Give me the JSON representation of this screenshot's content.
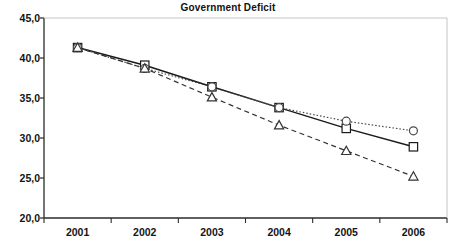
{
  "chart_data": {
    "type": "line",
    "title": "Government Deficit",
    "xlabel": "",
    "ylabel": "",
    "categories": [
      "2001",
      "2002",
      "2003",
      "2004",
      "2005",
      "2006"
    ],
    "x": [
      2001,
      2002,
      2003,
      2004,
      2005,
      2006
    ],
    "ylim": [
      20.0,
      45.0
    ],
    "ytick_labels": [
      "45,0",
      "40,0",
      "35,0",
      "30,0",
      "25,0",
      "20,0"
    ],
    "ytick_values": [
      45.0,
      40.0,
      35.0,
      30.0,
      25.0,
      20.0
    ],
    "xtick_labels": [
      "2001",
      "2002",
      "2003",
      "2004",
      "2005",
      "2006"
    ],
    "grid": false,
    "legend": "none",
    "decimal_separator": ",",
    "series": [
      {
        "name": "series-square-solid",
        "marker": "square",
        "line_style": "solid",
        "color": "#1a1a1a",
        "values": [
          41.3,
          39.1,
          36.4,
          33.8,
          31.2,
          28.9
        ]
      },
      {
        "name": "series-circle-dotted",
        "marker": "circle",
        "line_style": "dotted",
        "color": "#4a4a4a",
        "values": [
          41.3,
          38.7,
          36.4,
          33.8,
          32.1,
          30.9
        ]
      },
      {
        "name": "series-triangle-dashed",
        "marker": "triangle",
        "line_style": "dashed",
        "color": "#333333",
        "values": [
          41.3,
          38.7,
          35.1,
          31.6,
          28.4,
          25.2
        ]
      }
    ]
  },
  "axis": {
    "y_labels": [
      {
        "text": "45,0",
        "value": 45.0
      },
      {
        "text": "40,0",
        "value": 40.0
      },
      {
        "text": "35,0",
        "value": 35.0
      },
      {
        "text": "30,0",
        "value": 30.0
      },
      {
        "text": "25,0",
        "value": 25.0
      },
      {
        "text": "20,0",
        "value": 20.0
      }
    ],
    "x_labels": [
      {
        "text": "2001"
      },
      {
        "text": "2002"
      },
      {
        "text": "2003"
      },
      {
        "text": "2004"
      },
      {
        "text": "2005"
      },
      {
        "text": "2006"
      }
    ]
  },
  "colors": {
    "axis": "#2b2b2b",
    "plot_background": "#ffffff",
    "text": "#141414",
    "series_square": "#1a1a1a",
    "series_circle": "#4a4a4a",
    "series_triangle": "#333333"
  }
}
